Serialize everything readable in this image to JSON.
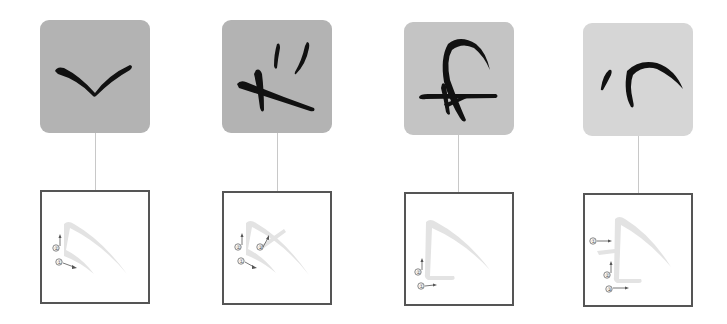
{
  "panels": [
    {
      "id": "panel-1",
      "tile_color": "#b3b3b3",
      "character_strokes": "v-shape",
      "stroke_order_labels": [
        "①",
        "②"
      ],
      "stroke_order": [
        {
          "label": "②",
          "direction": "up"
        },
        {
          "label": "①",
          "direction": "down-right"
        }
      ]
    },
    {
      "id": "panel-2",
      "tile_color": "#b3b3b3",
      "character_strokes": "cross-with-two-ticks",
      "stroke_order_labels": [
        "①",
        "②",
        "③"
      ],
      "stroke_order": [
        {
          "label": "②",
          "direction": "up"
        },
        {
          "label": "③",
          "direction": "up-right"
        },
        {
          "label": "①",
          "direction": "down-right"
        }
      ]
    },
    {
      "id": "panel-3",
      "tile_color": "#c4c4c4",
      "character_strokes": "crossed-loop",
      "stroke_order_labels": [
        "①",
        "②"
      ],
      "stroke_order": [
        {
          "label": "②",
          "direction": "up"
        },
        {
          "label": "①",
          "direction": "right"
        }
      ]
    },
    {
      "id": "panel-4",
      "tile_color": "#d6d6d6",
      "character_strokes": "tick-and-curve",
      "stroke_order_labels": [
        "①",
        "②",
        "③"
      ],
      "stroke_order": [
        {
          "label": "①",
          "direction": "right"
        },
        {
          "label": "②",
          "direction": "up"
        },
        {
          "label": "③",
          "direction": "right"
        }
      ]
    }
  ],
  "colors": {
    "ink": "#111111",
    "guide_stroke": "#e3e3e3",
    "box_border": "#555555",
    "connector": "#c8c8c8",
    "arrow": "#555555"
  }
}
